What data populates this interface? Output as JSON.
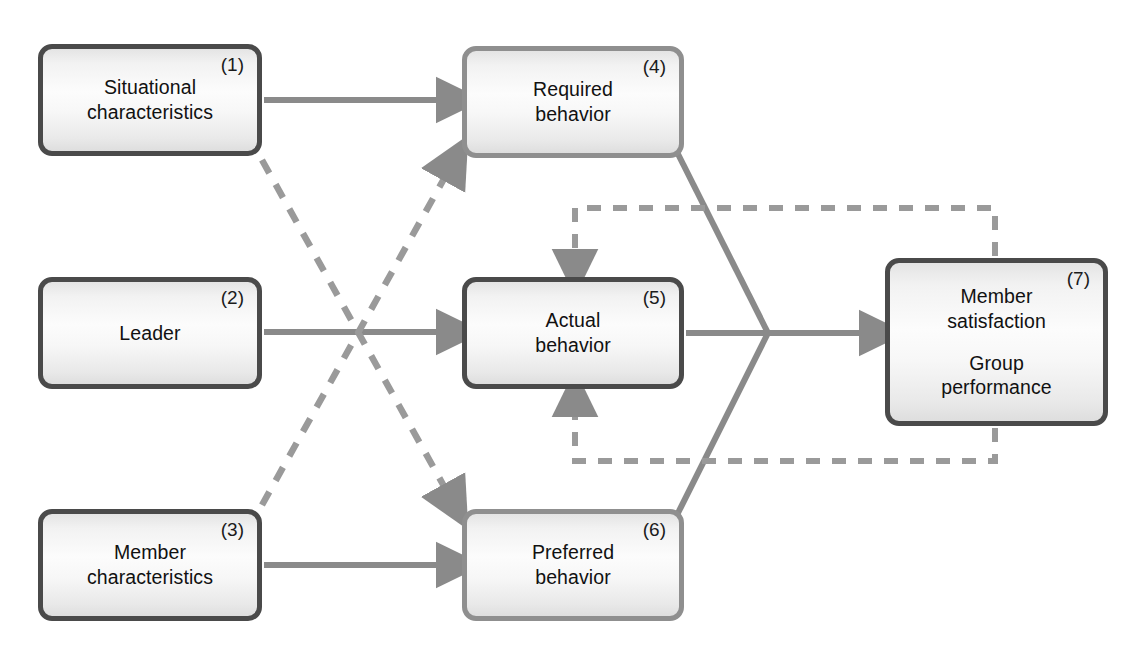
{
  "diagram": {
    "nodes": [
      {
        "id": "situational-characteristics",
        "index": "(1)",
        "label": "Situational\ncharacteristics",
        "border": "dark",
        "x": 38,
        "y": 44,
        "w": 224,
        "h": 112
      },
      {
        "id": "leader",
        "index": "(2)",
        "label": "Leader",
        "border": "dark",
        "x": 38,
        "y": 277,
        "w": 224,
        "h": 112
      },
      {
        "id": "member-characteristics",
        "index": "(3)",
        "label": "Member\ncharacteristics",
        "border": "dark",
        "x": 38,
        "y": 509,
        "w": 224,
        "h": 112
      },
      {
        "id": "required-behavior",
        "index": "(4)",
        "label": "Required\nbehavior",
        "border": "light",
        "x": 462,
        "y": 46,
        "w": 222,
        "h": 112
      },
      {
        "id": "actual-behavior",
        "index": "(5)",
        "label": "Actual\nbehavior",
        "border": "dark",
        "x": 462,
        "y": 277,
        "w": 222,
        "h": 112
      },
      {
        "id": "preferred-behavior",
        "index": "(6)",
        "label": "Preferred\nbehavior",
        "border": "light",
        "x": 462,
        "y": 509,
        "w": 222,
        "h": 112
      },
      {
        "id": "outcomes",
        "index": "(7)",
        "label_1": "Member\nsatisfaction",
        "label_2": "Group\nperformance",
        "border": "dark",
        "x": 885,
        "y": 258,
        "w": 223,
        "h": 168
      }
    ],
    "colors": {
      "arrow": "#8a8a8a",
      "border_dark": "#4a4a4a",
      "border_light": "#8f8f8f",
      "text": "#111111",
      "background": "#ffffff"
    },
    "edges": [
      {
        "id": "e1-4",
        "from": "(1)",
        "to": "(4)",
        "style": "solid",
        "arrow": true
      },
      {
        "id": "e2-5",
        "from": "(2)",
        "to": "(5)",
        "style": "solid",
        "arrow": true
      },
      {
        "id": "e3-6",
        "from": "(3)",
        "to": "(6)",
        "style": "solid",
        "arrow": true
      },
      {
        "id": "e1-6",
        "from": "(1)",
        "to": "(6)",
        "style": "dashed",
        "arrow": true
      },
      {
        "id": "e3-4",
        "from": "(3)",
        "to": "(4)",
        "style": "dashed",
        "arrow": true
      },
      {
        "id": "e4-7",
        "from": "(4)",
        "to": "(7)",
        "style": "solid",
        "arrow": false
      },
      {
        "id": "e6-7",
        "from": "(6)",
        "to": "(7)",
        "style": "solid",
        "arrow": false
      },
      {
        "id": "e5-7",
        "from": "(5)",
        "to": "(7)",
        "style": "solid",
        "arrow": true
      },
      {
        "id": "e7-5-top",
        "from": "(7)",
        "to": "(5)",
        "style": "dashed",
        "arrow": true
      },
      {
        "id": "e7-5-bottom",
        "from": "(7)",
        "to": "(5)",
        "style": "dashed",
        "arrow": true
      }
    ]
  }
}
